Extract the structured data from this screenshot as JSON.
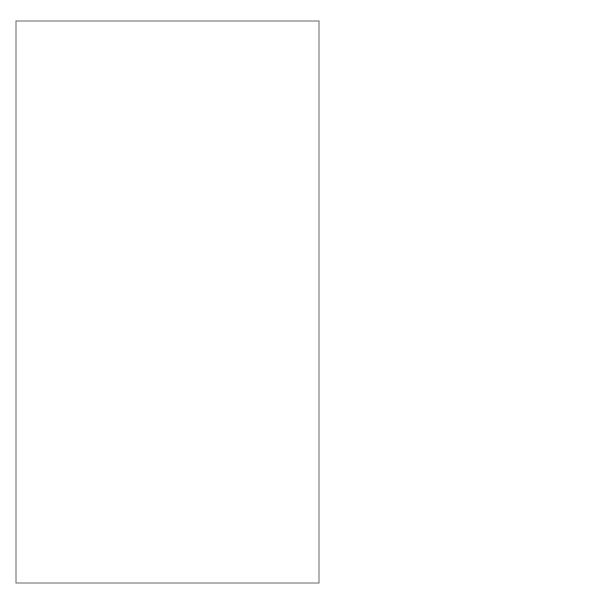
{
  "frame": {
    "keyword": "sm",
    "title": "Campaign Version 3"
  },
  "states": {
    "commissioned": "Commissioned",
    "active": "Active",
    "monitoring_region": "Monitoring",
    "running_region": "Running",
    "survey": "Survey",
    "evaluation": "Evaluation",
    "advert_preparation": "Advert Preparation",
    "scheduling": "Scheduling",
    "running_adverts": "Running Adverts",
    "suspended": "Suspended",
    "completed": "Completed",
    "paid": "Paid",
    "history_monitoring": "H",
    "history_running": "H"
  },
  "transitions": {
    "initial_to_commissioned": [
      "/assignManager; assignStaff"
    ],
    "commissioned_cancelled": [
      "campaignCancelled",
      "/calculateCosts;",
      "prepareFinalStatement"
    ],
    "commissioned_to_active": [
      "authorized(authorizationCode)",
      "[contract signed]",
      "/setCampaignActive"
    ],
    "active_to_suspended": [
      "suspendCampaign",
      "/stopAdverts"
    ],
    "suspended_resume": [
      "resumeCampaign"
    ],
    "survey_to_evaluation": [
      "surveyComplete"
    ],
    "evaluation_to_survey": [
      "runSurvey"
    ],
    "running_extend": [
      "extendCampaign",
      "/modifyBudget"
    ],
    "prep_to_scheduling": [
      "advertsApproved",
      "/authorize"
    ],
    "scheduling_to_running": [
      "confirmSchedule"
    ],
    "active_cancelled": [
      "campaignCancelled",
      "/cancelSchedule;",
      "calculateCosts;",
      "prepareFinalStatement"
    ],
    "active_completed": [
      "campaignCompleted",
      "/prepareFinalStatement"
    ],
    "completed_self": [
      "paymentReceived(payment)",
      "[paymentDue – payment > zero]"
    ],
    "completed_to_paid": [
      "paymentReceived(payment)",
      "[paymentDue – payment = zero]"
    ],
    "completed_refund": [
      "paymentReceived(payment)",
      "[paymentDue – payment < zero]",
      "/generateRefund"
    ],
    "paid_to_final": [
      "archiveCampaign",
      "/unassignStaff;",
      "unassignManager"
    ]
  }
}
